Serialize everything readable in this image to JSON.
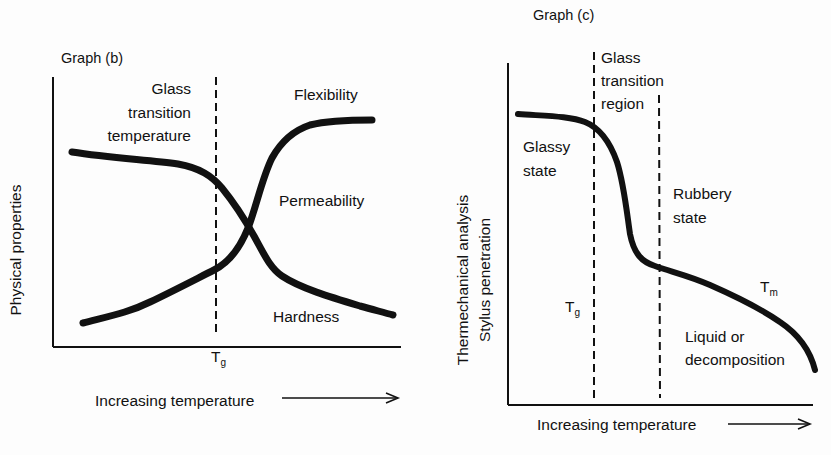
{
  "graph_b": {
    "title": "Graph (b)",
    "y_label": "Physical properties",
    "x_label": "Increasing temperature",
    "tg_annotation": [
      "Glass",
      "transition",
      "temperature"
    ],
    "tg_tick": {
      "main": "T",
      "sub": "g"
    },
    "curve_labels": {
      "flexibility": "Flexibility",
      "permeability": "Permeability",
      "hardness": "Hardness"
    }
  },
  "graph_c": {
    "title": "Graph (c)",
    "y_label_line1": "Thermechanical analysis",
    "y_label_line2": "Stylus penetration",
    "x_label": "Increasing temperature",
    "region_label": [
      "Glass",
      "transition",
      "region"
    ],
    "glassy_state": [
      "Glassy",
      "state"
    ],
    "rubbery_state": [
      "Rubbery",
      "state"
    ],
    "liquid_state": [
      "Liquid or",
      "decomposition"
    ],
    "tg_label": {
      "main": "T",
      "sub": "g"
    },
    "tm_label": {
      "main": "T",
      "sub": "m"
    }
  },
  "colors": {
    "ink": "#111111",
    "paper": "#fdfdfd"
  }
}
